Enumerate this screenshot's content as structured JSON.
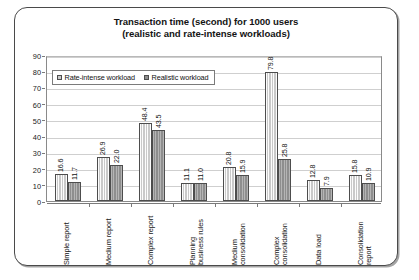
{
  "chart_data": {
    "type": "bar",
    "title": "Transaction time (second) for 1000 users (realistic and rate-intense workloads)",
    "title_lines": [
      "Transaction time (second) for 1000 users",
      "(realistic and rate-intense workloads)"
    ],
    "xlabel": "",
    "ylabel": "",
    "ylim": [
      0,
      90
    ],
    "yticks": [
      0,
      10,
      20,
      30,
      40,
      50,
      60,
      70,
      80,
      90
    ],
    "grid": true,
    "legend_position": "top-left-inside",
    "categories": [
      "Simple report",
      "Medium report",
      "Complex report",
      "Planning business rules",
      "Medium consolidation",
      "Complex consolidation",
      "Data load",
      "Consolidation report"
    ],
    "category_lines": [
      [
        "Simple report"
      ],
      [
        "Medium report"
      ],
      [
        "Complex report"
      ],
      [
        "Planning",
        "business rules"
      ],
      [
        "Medium",
        "consolidation"
      ],
      [
        "Complex",
        "consolidation"
      ],
      [
        "Data load"
      ],
      [
        "Consolidation",
        "report"
      ]
    ],
    "series": [
      {
        "name": "Rate-intense workload",
        "color": "#c9c9c9",
        "values": [
          16.6,
          26.9,
          48.4,
          11.1,
          20.8,
          79.8,
          12.8,
          15.8
        ],
        "labels": [
          "16.6",
          "26.9",
          "48.4",
          "11.1",
          "20.8",
          "79.8",
          "12.8",
          "15.8"
        ]
      },
      {
        "name": "Realistic workload",
        "color": "#8e8e8e",
        "values": [
          11.7,
          22.0,
          43.5,
          11.0,
          15.9,
          25.8,
          7.9,
          10.9
        ],
        "labels": [
          "11.7",
          "22.0",
          "43.5",
          "11.0",
          "15.9",
          "25.8",
          "7.9",
          "10.9"
        ]
      }
    ]
  }
}
